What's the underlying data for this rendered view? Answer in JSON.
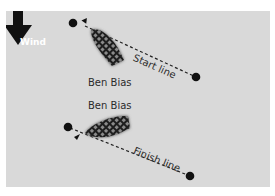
{
  "diagram": {
    "wind": {
      "label": "Wind",
      "direction": "down"
    },
    "start": {
      "boat_label": "Ben Bias",
      "line_label": "Start line"
    },
    "finish": {
      "boat_label": "Ben Bias",
      "line_label": "Finish line"
    },
    "colors": {
      "background": "#d9d9d9",
      "ink": "#111111",
      "text": "#2b2b2b",
      "boat_hull": "#3a3a3a"
    }
  }
}
